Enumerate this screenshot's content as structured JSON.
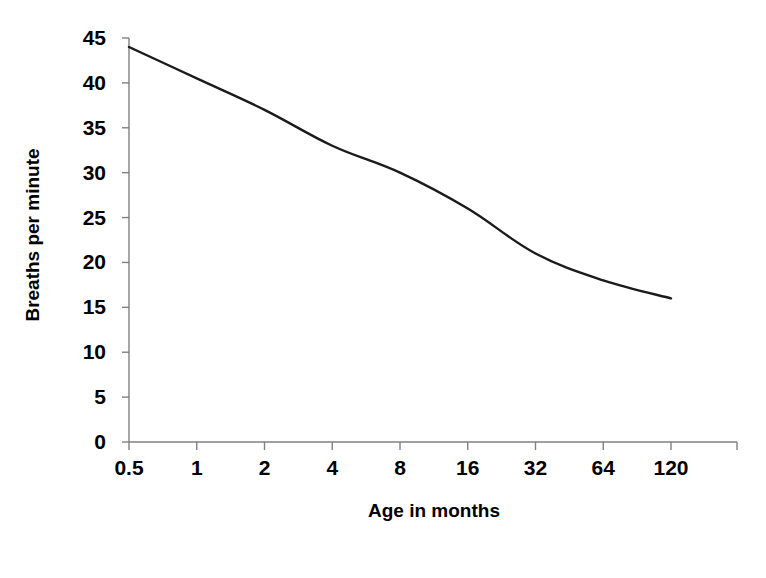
{
  "chart_data": {
    "type": "line",
    "title": "",
    "subtitle": "",
    "xlabel": "Age in months",
    "ylabel": "Breaths per minute",
    "categories": [
      "0.5",
      "1",
      "2",
      "4",
      "8",
      "16",
      "32",
      "64",
      "120"
    ],
    "values": [
      44,
      40.5,
      37,
      33,
      30,
      26,
      21,
      18,
      16
    ],
    "series": [
      {
        "name": "Respiratory rate",
        "values": [
          44,
          40.5,
          37,
          33,
          30,
          26,
          21,
          18,
          16
        ]
      }
    ],
    "ylim": [
      0,
      45
    ],
    "yticks": [
      0,
      5,
      10,
      15,
      20,
      25,
      30,
      35,
      40,
      45
    ],
    "ytick_labels": [
      "0",
      "5",
      "10",
      "15",
      "20",
      "25",
      "30",
      "35",
      "40",
      "45"
    ],
    "xtick_labels": [
      "0.5",
      "1",
      "2",
      "4",
      "8",
      "16",
      "32",
      "64",
      "120"
    ],
    "grid": false,
    "legend": "none",
    "line_color": "#1a1a1a",
    "axis_color": "#808080",
    "background_color": "#ffffff"
  }
}
